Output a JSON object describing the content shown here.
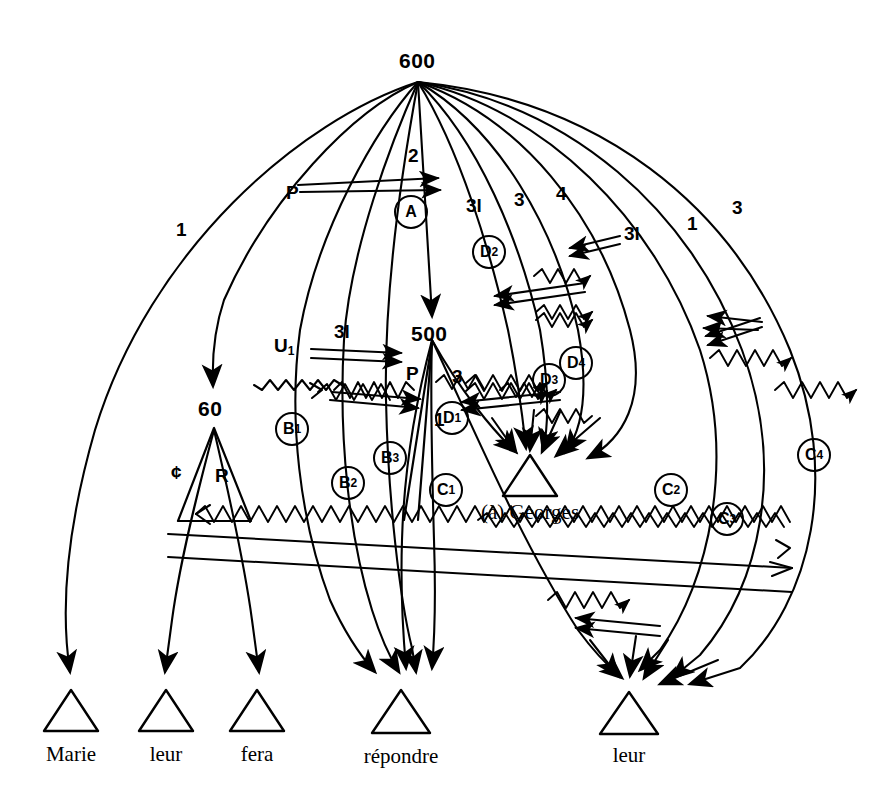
{
  "diagram": {
    "ink_color": "#000000",
    "background": "#ffffff"
  },
  "nodes": {
    "root": {
      "label": "600",
      "x": 418,
      "y": 64
    },
    "mid": {
      "label": "500",
      "x": 430,
      "y": 337
    },
    "sub": {
      "label": "60",
      "x": 214,
      "y": 412
    }
  },
  "leaves": [
    {
      "id": "leaf-marie",
      "label": "Marie",
      "x": 71,
      "y": 756
    },
    {
      "id": "leaf-leur-1",
      "label": "leur",
      "x": 166,
      "y": 756
    },
    {
      "id": "leaf-fera",
      "label": "fera",
      "x": 257,
      "y": 756
    },
    {
      "id": "leaf-repondre",
      "label": "répondre",
      "x": 401,
      "y": 758
    },
    {
      "id": "leaf-georges",
      "label": "(à) Georges",
      "x": 530,
      "y": 514
    },
    {
      "id": "leaf-leur-2",
      "label": "leur",
      "x": 629,
      "y": 757
    }
  ],
  "edge_labels": [
    {
      "id": "edge-1-left",
      "text": "1",
      "x": 176,
      "y": 228
    },
    {
      "id": "edge-p-left",
      "text": "P",
      "x": 291,
      "y": 193
    },
    {
      "id": "edge-2",
      "text": "2",
      "x": 413,
      "y": 156
    },
    {
      "id": "edge-31-a",
      "text": "3l",
      "x": 474,
      "y": 206
    },
    {
      "id": "edge-3-a",
      "text": "3",
      "x": 518,
      "y": 200
    },
    {
      "id": "edge-4",
      "text": "4",
      "x": 560,
      "y": 194
    },
    {
      "id": "edge-31-b",
      "text": "3l",
      "x": 632,
      "y": 234
    },
    {
      "id": "edge-1-right",
      "text": "1",
      "x": 689,
      "y": 224
    },
    {
      "id": "edge-3-right",
      "text": "3",
      "x": 735,
      "y": 208
    },
    {
      "id": "edge-31-c",
      "text": "3l",
      "x": 342,
      "y": 332
    },
    {
      "id": "edge-u1",
      "text": "U",
      "sub": "1",
      "x": 281,
      "y": 346
    },
    {
      "id": "edge-p-mid",
      "text": "P",
      "x": 410,
      "y": 374
    },
    {
      "id": "edge-3-mid",
      "text": "3",
      "x": 456,
      "y": 377
    },
    {
      "id": "edge-1-mid",
      "text": "1",
      "x": 436,
      "y": 420
    },
    {
      "id": "edge-cent",
      "text": "¢",
      "x": 176,
      "y": 474
    },
    {
      "id": "edge-r",
      "text": "R",
      "x": 221,
      "y": 477
    }
  ],
  "circles": [
    {
      "id": "circle-a",
      "letter": "A",
      "sub": "",
      "x": 411,
      "y": 212
    },
    {
      "id": "circle-d2",
      "letter": "D",
      "sub": "2",
      "x": 489,
      "y": 252
    },
    {
      "id": "circle-d4",
      "letter": "D",
      "sub": "4",
      "x": 576,
      "y": 363
    },
    {
      "id": "circle-d3",
      "letter": "D",
      "sub": "3",
      "x": 549,
      "y": 380
    },
    {
      "id": "circle-d1",
      "letter": "D",
      "sub": "1",
      "x": 452,
      "y": 418
    },
    {
      "id": "circle-b1",
      "letter": "B",
      "sub": "1",
      "x": 292,
      "y": 429
    },
    {
      "id": "circle-b3",
      "letter": "B",
      "sub": "3",
      "x": 390,
      "y": 458
    },
    {
      "id": "circle-b2",
      "letter": "B",
      "sub": "2",
      "x": 348,
      "y": 483
    },
    {
      "id": "circle-c1",
      "letter": "C",
      "sub": "1",
      "x": 446,
      "y": 490
    },
    {
      "id": "circle-c4",
      "letter": "C",
      "sub": "4",
      "x": 814,
      "y": 455
    },
    {
      "id": "circle-c2",
      "letter": "C",
      "sub": "2",
      "x": 671,
      "y": 490
    },
    {
      "id": "circle-c3",
      "letter": "C",
      "sub": "3",
      "x": 727,
      "y": 519
    }
  ]
}
